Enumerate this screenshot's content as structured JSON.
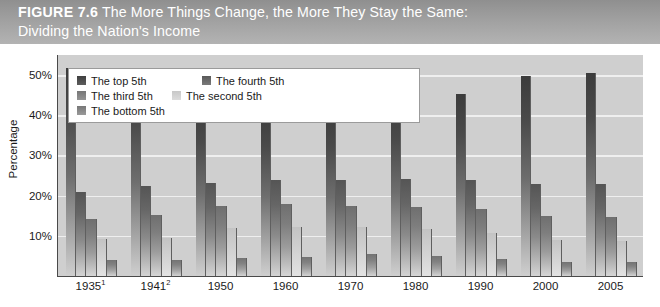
{
  "figure": {
    "label": "FIGURE 7.6",
    "title_line1": "The More Things Change, the More They Stay the Same:",
    "title_line2": "Dividing the Nation's Income"
  },
  "legend": {
    "items": [
      {
        "label": "The top 5th",
        "swatch": "dark-gray-swatch"
      },
      {
        "label": "The fourth 5th",
        "swatch": "medium-dark-gray-swatch"
      },
      {
        "label": "The third 5th",
        "swatch": "medium-gray-swatch"
      },
      {
        "label": "The second 5th",
        "swatch": "light-gray-swatch"
      },
      {
        "label": "The bottom 5th",
        "swatch": "mid-gray-swatch"
      }
    ]
  },
  "chart_data": {
    "type": "bar",
    "title": "The More Things Change, the More They Stay the Same: Dividing the Nation's Income",
    "xlabel": "",
    "ylabel": "Percentage",
    "ylim": [
      0,
      55
    ],
    "yticks": [
      10,
      20,
      30,
      40,
      50
    ],
    "ytick_labels": [
      "10%",
      "20%",
      "30%",
      "40%",
      "50%"
    ],
    "grid": true,
    "legend_position": "top-left-inside",
    "categories": [
      "1935",
      "1941",
      "1950",
      "1960",
      "1970",
      "1980",
      "1990",
      "2000",
      "2005"
    ],
    "category_labels": [
      "1935¹",
      "1941²",
      "1950",
      "1960",
      "1970",
      "1980",
      "1990",
      "2000",
      "2005"
    ],
    "footnote_markers": {
      "1935": "1",
      "1941": "2"
    },
    "series": [
      {
        "name": "The top 5th",
        "values": [
          51.7,
          48.8,
          42.7,
          41.3,
          40.9,
          43.3,
          45.3,
          49.8,
          50.4
        ]
      },
      {
        "name": "The fourth 5th",
        "values": [
          20.9,
          22.3,
          23.1,
          23.8,
          23.8,
          24.1,
          23.8,
          23.0,
          22.9
        ]
      },
      {
        "name": "The third 5th",
        "values": [
          14.1,
          15.3,
          17.4,
          17.8,
          17.4,
          17.1,
          16.6,
          15.0,
          14.6
        ]
      },
      {
        "name": "The second 5th",
        "values": [
          9.2,
          9.5,
          12.0,
          12.2,
          12.2,
          11.6,
          10.8,
          9.0,
          8.6
        ]
      },
      {
        "name": "The bottom 5th",
        "values": [
          4.1,
          4.1,
          4.5,
          4.8,
          5.4,
          5.1,
          4.3,
          3.6,
          3.4
        ]
      }
    ]
  }
}
